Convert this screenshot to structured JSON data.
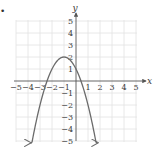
{
  "chart_data": {
    "type": "line",
    "title": "",
    "xlabel": "x",
    "ylabel": "y",
    "xlim": [
      -5,
      5
    ],
    "ylim": [
      -5,
      5
    ],
    "grid": true,
    "x_ticks": [
      -5,
      -4,
      -3,
      -2,
      -1,
      1,
      2,
      3,
      4,
      5
    ],
    "y_ticks": [
      5,
      4,
      3,
      2,
      1,
      -1,
      -2,
      -3,
      -4,
      -5
    ],
    "series": [
      {
        "name": "parabola",
        "equation": "y = -(x+1)^2 + 2",
        "vertex": [
          -1,
          2
        ],
        "y_intercept": 1,
        "x_intercepts": [
          -2.41,
          0.41
        ],
        "x": [
          -3.8,
          -3.5,
          -3,
          -2.5,
          -2,
          -1.5,
          -1,
          -0.5,
          0,
          0.5,
          1,
          1.5,
          1.8
        ],
        "values": [
          -5.84,
          -4.25,
          -2,
          -0.25,
          1,
          1.75,
          2,
          1.75,
          1,
          -0.25,
          -2,
          -4.25,
          -5.84
        ],
        "arrows_at_ends": true,
        "color": "#6b6b6b"
      }
    ]
  },
  "labels": {
    "x_axis": "x",
    "y_axis": "y",
    "x_tick_labels": [
      "−5",
      "−4",
      "−3",
      "−2",
      "−1",
      "1",
      "2",
      "3",
      "4",
      "5"
    ],
    "y_tick_labels": [
      "5",
      "4",
      "3",
      "2",
      "1",
      "−1",
      "−2",
      "−3",
      "−4",
      "−5"
    ]
  },
  "colors": {
    "grid": "#e2e2e2",
    "axis": "#555555",
    "curve": "#6b6b6b",
    "text": "#3a3a3a"
  },
  "marker": "•"
}
